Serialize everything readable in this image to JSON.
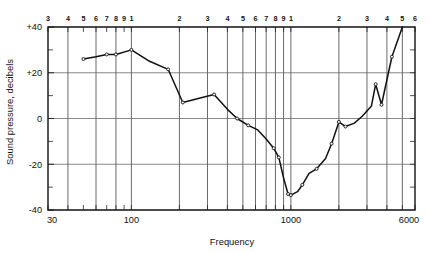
{
  "chart_data": {
    "type": "line",
    "title": "",
    "xlabel": "Frequency",
    "ylabel": "Sound pressure, decibels",
    "xscale": "log",
    "xlim": [
      30,
      6000
    ],
    "ylim": [
      -40,
      40
    ],
    "grid": true,
    "legend": "none",
    "x_tick_labels": [
      "30",
      "100",
      "1000",
      "6000"
    ],
    "x_tick_values": [
      30,
      100,
      1000,
      6000
    ],
    "y_tick_labels": [
      "+40",
      "+20",
      "0",
      "-20",
      "-40"
    ],
    "y_tick_values": [
      40,
      20,
      0,
      -20,
      -40
    ],
    "y_minor_ticks": [
      30,
      10,
      -10,
      -30
    ],
    "top_axis_labels": [
      {
        "label": "3",
        "value": 30
      },
      {
        "label": "4",
        "value": 40
      },
      {
        "label": "5",
        "value": 50
      },
      {
        "label": "6",
        "value": 60
      },
      {
        "label": "7",
        "value": 70
      },
      {
        "label": "8",
        "value": 80
      },
      {
        "label": "9",
        "value": 90
      },
      {
        "label": "1",
        "value": 100
      },
      {
        "label": "2",
        "value": 200
      },
      {
        "label": "3",
        "value": 300
      },
      {
        "label": "4",
        "value": 400
      },
      {
        "label": "5",
        "value": 500
      },
      {
        "label": "6",
        "value": 600
      },
      {
        "label": "7",
        "value": 700
      },
      {
        "label": "8",
        "value": 800
      },
      {
        "label": "9",
        "value": 900
      },
      {
        "label": "1",
        "value": 1000
      },
      {
        "label": "2",
        "value": 2000
      },
      {
        "label": "3",
        "value": 3000
      },
      {
        "label": "4",
        "value": 4000
      },
      {
        "label": "5",
        "value": 5000
      },
      {
        "label": "6",
        "value": 6000
      }
    ],
    "major_gridlines_x": [
      40,
      60,
      80,
      100,
      200,
      300,
      400,
      500,
      600,
      700,
      800,
      900,
      1000,
      2000,
      3000,
      4000,
      5000
    ],
    "series": [
      {
        "name": "sound pressure response",
        "color": "#111111",
        "x": [
          50,
          60,
          70,
          80,
          100,
          130,
          170,
          210,
          270,
          330,
          400,
          460,
          540,
          620,
          700,
          780,
          840,
          900,
          960,
          1000,
          1100,
          1180,
          1300,
          1450,
          1650,
          1800,
          2000,
          2200,
          2500,
          2800,
          3200,
          3400,
          3700,
          4300,
          5000
        ],
        "y": [
          26,
          27,
          28,
          28,
          30,
          25,
          21.5,
          7,
          9,
          10.5,
          4,
          0,
          -3,
          -5,
          -9,
          -13,
          -17,
          -26,
          -33,
          -33.5,
          -32,
          -29,
          -24,
          -22,
          -17.5,
          -11,
          -1.5,
          -3.5,
          -2,
          1,
          5.5,
          15,
          6,
          27,
          40
        ]
      }
    ],
    "markers_x": [
      50,
      70,
      80,
      100,
      170,
      210,
      330,
      460,
      540,
      780,
      840,
      960,
      1000,
      1180,
      1450,
      1800,
      2000,
      2200,
      3400,
      3700,
      4300
    ],
    "annotations": []
  },
  "colors": {
    "background": "#ffffff",
    "axis": "#121212",
    "grid": "#5a5a5a",
    "series": "#111111"
  }
}
